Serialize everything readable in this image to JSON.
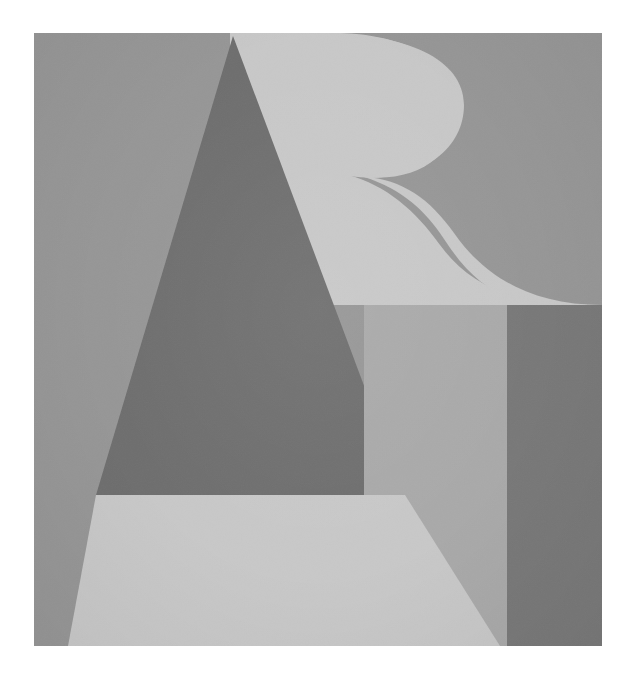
{
  "artwork": {
    "title": "Abstract Geometric Composition",
    "medium": "Grayscale print on textured paper",
    "orientation": "portrait",
    "canvas": {
      "width": 637,
      "height": 686,
      "background": "#ffffff"
    },
    "plate": {
      "x": 34,
      "y": 33,
      "width": 568,
      "height": 613,
      "background": "#969696"
    },
    "palette": {
      "paper_white": "#ffffff",
      "background_gray": "#969696",
      "triangle_dark": "#6e6e6e",
      "light_gray": "#c8c8c8",
      "mid_gray": "#a9a9a9",
      "rectangle_dark": "#787878"
    },
    "shapes": [
      {
        "name": "background-field",
        "kind": "rectangle",
        "fill": "#969696",
        "points": "0,0 568,0 568,613 0,613"
      },
      {
        "name": "letter-r-glyph",
        "kind": "path",
        "fill": "#c8c8c8",
        "description": "Large light letter R: vertical stem, rounded bowl at top right, S-curved leg sweeping to lower right",
        "d": "M 180 3 L 276 3 C 372 3 430 38 430 100 C 430 148 390 178 314 142 C 352 168 330 168 314 142 L 180 330 Z"
      },
      {
        "name": "triangle-upper-dark",
        "kind": "polygon",
        "fill": "#6e6e6e",
        "description": "Upper portion of the large isosceles triangle, above the horizontal band line",
        "points": "199,3 371,462 62,462"
      },
      {
        "name": "triangle-lower-light",
        "kind": "polygon",
        "fill": "#c8c8c8",
        "description": "Lower trapezoid of the triangle below the horizontal band line",
        "points": "62,462 371,462 466,613 34,613"
      },
      {
        "name": "panel-mid-gray",
        "kind": "polygon",
        "fill": "#a9a9a9",
        "description": "Mid-tone rectangular panel below the R leg, left of the dark rectangle",
        "points": "330,270 473,270 473,613 330,613"
      },
      {
        "name": "rectangle-dark-right",
        "kind": "polygon",
        "fill": "#787878",
        "description": "Dark vertical rectangle on the right edge",
        "points": "473,270 568,270 568,613 473,613"
      }
    ],
    "geometry_notes": {
      "triangle_apex": [
        233,
        36
      ],
      "triangle_base_left": [
        68,
        646
      ],
      "triangle_base_right": [
        500,
        646
      ],
      "band_line_y": 495,
      "panel_top_y": 303,
      "panel_split_x": 507,
      "r_bowl_max_x": 460,
      "r_bowl_tip": [
        348,
        175
      ]
    }
  }
}
